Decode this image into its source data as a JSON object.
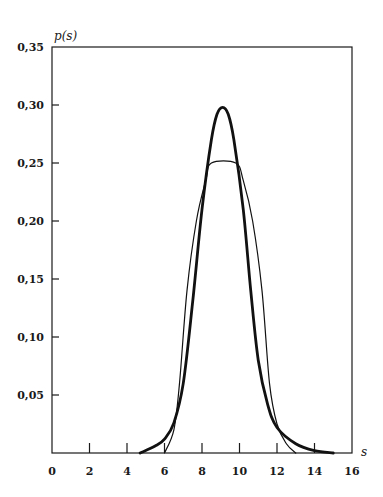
{
  "chart_data": {
    "type": "line",
    "title": "",
    "xlabel": "s",
    "ylabel": "p(s)",
    "xlim": [
      0,
      16
    ],
    "ylim": [
      0,
      0.35
    ],
    "grid": false,
    "legend": null,
    "x_ticks": [
      0,
      2,
      4,
      6,
      8,
      10,
      12,
      14,
      16
    ],
    "x_tick_labels": [
      "0",
      "2",
      "4",
      "6",
      "8",
      "10",
      "12",
      "14",
      "16"
    ],
    "y_ticks": [
      0.05,
      0.1,
      0.15,
      0.2,
      0.25,
      0.3,
      0.35
    ],
    "y_tick_labels": [
      "0,05",
      "0,10",
      "0,15",
      "0,20",
      "0,25",
      "0,30",
      "0,35"
    ],
    "series": [
      {
        "name": "thick curve (bell-shaped)",
        "style": "thick",
        "x": [
          4.7,
          5.5,
          6.0,
          6.5,
          7.0,
          7.5,
          8.0,
          8.5,
          8.8,
          9.1,
          9.4,
          9.7,
          10.2,
          10.6,
          11.0,
          11.5,
          12.0,
          13.0,
          14.0,
          15.0
        ],
        "y": [
          0.0,
          0.006,
          0.012,
          0.026,
          0.06,
          0.13,
          0.21,
          0.27,
          0.292,
          0.298,
          0.292,
          0.27,
          0.21,
          0.14,
          0.08,
          0.042,
          0.022,
          0.008,
          0.002,
          0.0
        ]
      },
      {
        "name": "thin curve (flat-topped)",
        "style": "thin",
        "x": [
          6.0,
          6.5,
          6.8,
          7.2,
          7.7,
          8.2,
          8.5,
          9.8,
          10.2,
          10.7,
          11.2,
          11.6,
          12.0,
          12.5,
          13.0
        ],
        "y": [
          0.0,
          0.02,
          0.06,
          0.14,
          0.2,
          0.235,
          0.25,
          0.25,
          0.235,
          0.2,
          0.14,
          0.06,
          0.025,
          0.008,
          0.0
        ]
      }
    ]
  }
}
